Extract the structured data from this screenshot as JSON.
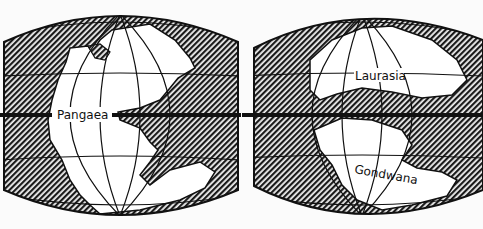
{
  "figure": {
    "colors": {
      "ocean_hatch_dark": "#1a1a1a",
      "ocean_hatch_light": "#f2f2f2",
      "land": "#ffffff",
      "outline": "#111111",
      "background": "#fbfbfb"
    },
    "panels": [
      {
        "id": "left",
        "labels": [
          {
            "text": "Pangaea",
            "role": "supercontinent"
          }
        ]
      },
      {
        "id": "right",
        "labels": [
          {
            "text": "Laurasia",
            "role": "northern-continent"
          },
          {
            "text": "Gondwana",
            "role": "southern-continent"
          }
        ]
      }
    ]
  }
}
